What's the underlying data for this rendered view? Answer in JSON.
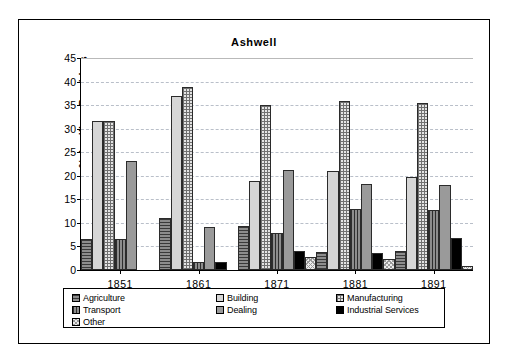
{
  "chart_data": {
    "type": "bar",
    "title": "Ashwell",
    "xlabel": "",
    "ylabel": "% Ancillary Providers",
    "ylim": [
      0,
      45
    ],
    "ytick_labels": [
      "0",
      "5",
      "10",
      "15",
      "20",
      "25",
      "30",
      "35",
      "40",
      "45"
    ],
    "ytick_values": [
      0,
      5,
      10,
      15,
      20,
      25,
      30,
      35,
      40,
      45
    ],
    "grid": true,
    "legend_position": "bottom",
    "categories": [
      "1851",
      "1861",
      "1871",
      "1881",
      "1891"
    ],
    "series": [
      {
        "name": "Agriculture",
        "fill": "horizontal-lines-dark",
        "color": "#8d8d8d",
        "values": [
          6.6,
          11.0,
          9.3,
          3.8,
          4.0
        ]
      },
      {
        "name": "Building",
        "fill": "solid-light",
        "color": "#d6d6d6",
        "values": [
          31.6,
          37.0,
          18.8,
          21.1,
          19.7
        ]
      },
      {
        "name": "Manufacturing",
        "fill": "grid-hatch",
        "color": "#e4e4e4",
        "values": [
          31.6,
          38.8,
          35.0,
          35.8,
          35.4
        ]
      },
      {
        "name": "Transport",
        "fill": "vertical-lines",
        "color": "#8d8d8d",
        "values": [
          6.6,
          1.7,
          7.9,
          13.0,
          12.8
        ]
      },
      {
        "name": "Dealing",
        "fill": "solid-mid",
        "color": "#9a9a9a",
        "values": [
          23.1,
          9.1,
          21.3,
          18.3,
          18.0
        ]
      },
      {
        "name": "Industrial Services",
        "fill": "solid-black",
        "color": "#000000",
        "values": [
          0,
          1.7,
          4.1,
          3.7,
          6.8
        ]
      },
      {
        "name": "Other",
        "fill": "dotted-light",
        "color": "#ececec",
        "values": [
          0,
          0,
          2.7,
          2.3,
          0.8
        ]
      }
    ]
  },
  "legend": {
    "columns": [
      [
        "Agriculture",
        "Transport",
        "Other"
      ],
      [
        "Building",
        "Dealing"
      ],
      [
        "Manufacturing",
        "Industrial Services"
      ]
    ]
  }
}
